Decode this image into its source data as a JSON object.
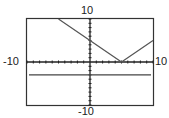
{
  "chart_data": {
    "type": "line",
    "title": "",
    "xlabel": "",
    "ylabel": "",
    "xlim": [
      -10,
      10
    ],
    "ylim": [
      -10,
      10
    ],
    "tick_step": 1,
    "grid": false,
    "labels": {
      "xmin": "-10",
      "xmax": "10",
      "ymin": "-10",
      "ymax": "10"
    },
    "series": [
      {
        "name": "y = |x - 5|",
        "x": [
          -5,
          5,
          10
        ],
        "y": [
          10,
          0,
          5
        ]
      },
      {
        "name": "y = -3",
        "x": [
          -10,
          10
        ],
        "y": [
          -3,
          -3
        ]
      }
    ]
  },
  "colors": {
    "frame": "#333333",
    "axis": "#222222",
    "curve": "#555555",
    "line": "#444444"
  }
}
